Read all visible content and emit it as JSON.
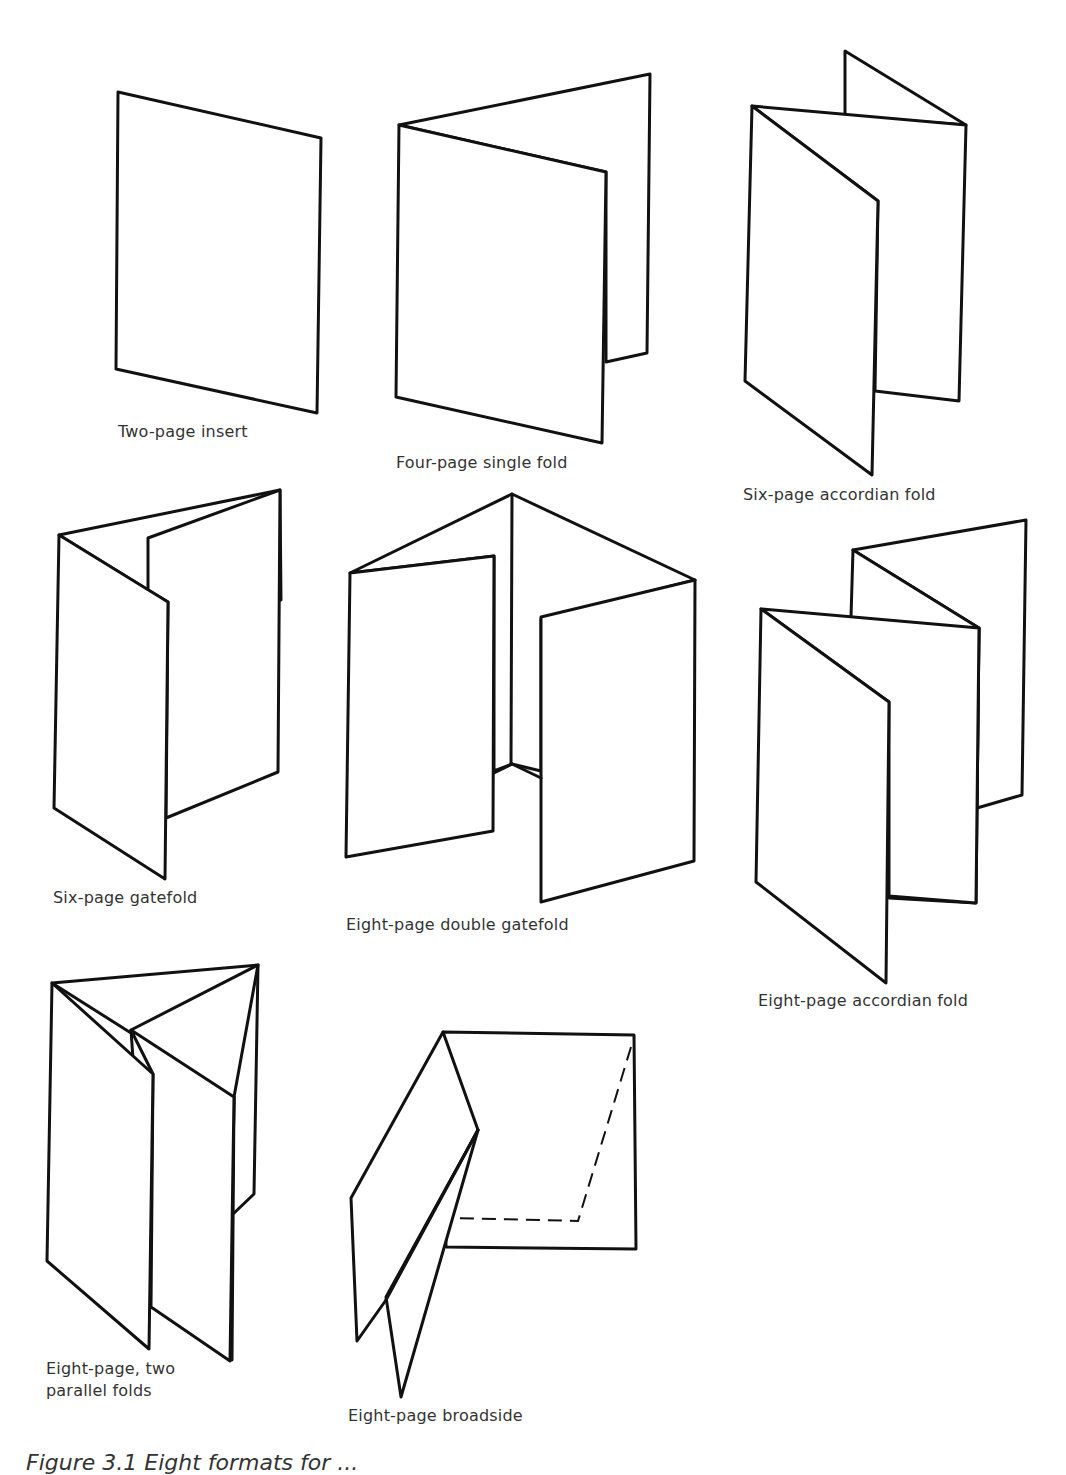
{
  "figure": {
    "caption_partial": "Figure 3.1   Eight formats for ...",
    "colors": {
      "ink": "#111111",
      "paper": "#ffffff",
      "text": "#333333"
    },
    "formats": [
      {
        "id": "two-page-insert",
        "label": "Two-page insert"
      },
      {
        "id": "four-page-single-fold",
        "label": "Four-page single fold"
      },
      {
        "id": "six-page-accordian-fold",
        "label": "Six-page accordian fold"
      },
      {
        "id": "six-page-gatefold",
        "label": "Six-page gatefold"
      },
      {
        "id": "eight-page-double-gatefold",
        "label": "Eight-page double gatefold"
      },
      {
        "id": "eight-page-accordian-fold",
        "label": "Eight-page accordian fold"
      },
      {
        "id": "eight-page-two-parallel-folds",
        "label": "Eight-page, two\nparallel folds"
      },
      {
        "id": "eight-page-broadside",
        "label": "Eight-page broadside"
      }
    ]
  }
}
